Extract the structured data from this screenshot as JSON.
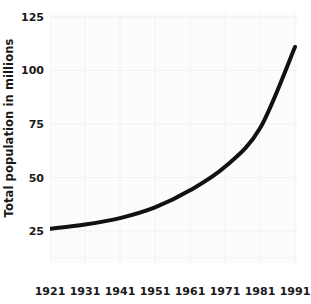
{
  "chart_data": {
    "type": "line",
    "title": "",
    "xlabel": "",
    "ylabel": "Total population in millions",
    "x": [
      1921,
      1931,
      1941,
      1951,
      1961,
      1971,
      1981,
      1991
    ],
    "xtick_labels": [
      "1921",
      "1931",
      "1941",
      "1951",
      "1961",
      "1971",
      "1981",
      "1991"
    ],
    "ytick_labels": [
      "125",
      "100",
      "75",
      "50",
      "25"
    ],
    "ytick_values": [
      125,
      100,
      75,
      50,
      25
    ],
    "xlim": [
      1921,
      1991
    ],
    "ylim": [
      0,
      125
    ],
    "grid": true,
    "legend": null,
    "series": [
      {
        "name": "Total population",
        "values": [
          26,
          28,
          31,
          36,
          44,
          55,
          73,
          111
        ]
      }
    ],
    "line_color": "#111111",
    "line_width": 4,
    "plot_background": "#fcfcfc",
    "grid_color": "#f2f2f2",
    "text_color": "#1a1a1a"
  }
}
